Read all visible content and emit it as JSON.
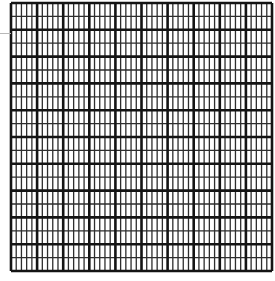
{
  "grid": {
    "x": 11,
    "y": 3,
    "width": 261,
    "height": 268,
    "columns": 50,
    "rows": 20,
    "major_every_col": 5,
    "major_every_row": 2,
    "colors": {
      "background": "#ffffff",
      "major_line": "#141414",
      "minor_line": "#2e2e2e"
    },
    "major_stroke": 2.6,
    "minor_stroke": 1.3
  },
  "guide": {
    "y": 33,
    "color": "#b8b8b8"
  }
}
